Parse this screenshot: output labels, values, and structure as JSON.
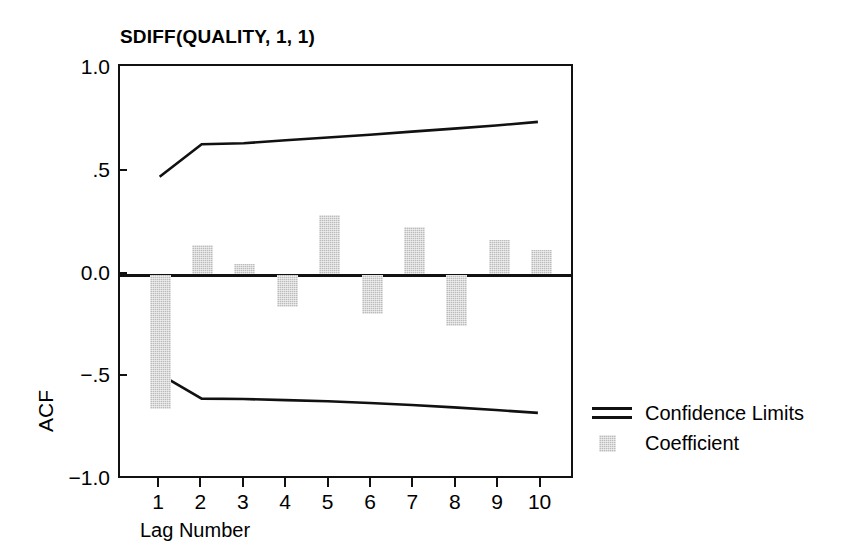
{
  "chart_data": {
    "type": "bar",
    "title": "SDIFF(QUALITY, 1, 1)",
    "xlabel": "Lag Number",
    "ylabel": "ACF",
    "categories": [
      1,
      2,
      3,
      4,
      5,
      6,
      7,
      8,
      9,
      10
    ],
    "values": [
      -0.655,
      0.145,
      0.053,
      -0.16,
      0.29,
      -0.19,
      0.23,
      -0.25,
      0.17,
      0.12
    ],
    "series": [
      {
        "name": "Coefficient",
        "type": "bar",
        "values": [
          -0.655,
          0.145,
          0.053,
          -0.16,
          0.29,
          -0.19,
          0.23,
          -0.25,
          0.17,
          0.12
        ]
      },
      {
        "name": "Upper Confidence Limit",
        "type": "line",
        "values": [
          0.47,
          0.63,
          0.635,
          0.65,
          0.663,
          0.677,
          0.692,
          0.707,
          0.722,
          0.74
        ]
      },
      {
        "name": "Lower Confidence Limit",
        "type": "line",
        "values": [
          -0.5,
          -0.62,
          -0.622,
          -0.627,
          -0.633,
          -0.641,
          -0.651,
          -0.663,
          -0.676,
          -0.69
        ]
      }
    ],
    "ylim": [
      -1.0,
      1.0
    ],
    "xlim": [
      0.4,
      10.6
    ],
    "ytick_labels": [
      "1.0",
      ".5",
      "0.0",
      "−.5",
      "−1.0"
    ],
    "ytick_values": [
      1.0,
      0.5,
      0.0,
      -0.5,
      -1.0
    ],
    "xtick_labels": [
      "1",
      "2",
      "3",
      "4",
      "5",
      "6",
      "7",
      "8",
      "9",
      "10"
    ],
    "grid": false,
    "legend_position": "right",
    "legend": [
      {
        "label": "Confidence Limits",
        "key": "double-line",
        "color": "#111111"
      },
      {
        "label": "Coefficient",
        "key": "gray-swatch",
        "color": "#bcbcbc"
      }
    ],
    "colors": {
      "bar": "#bcbcbc",
      "line": "#111111",
      "axis": "#111111",
      "background": "#ffffff"
    }
  }
}
